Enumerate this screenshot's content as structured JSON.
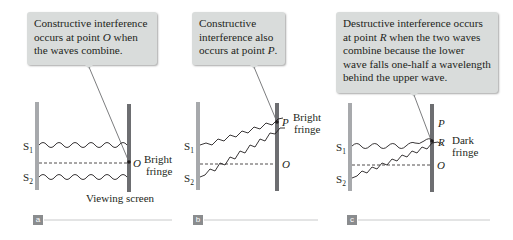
{
  "figure": {
    "panels": [
      {
        "id": "a",
        "tag": "a",
        "callout": {
          "line1": "Constructive interference",
          "line2_pre": "occurs at point ",
          "line2_point": "O",
          "line2_post": " when",
          "line3": "the waves combine."
        },
        "sources": [
          "S",
          "S"
        ],
        "source_subs": [
          "1",
          "2"
        ],
        "point_labels": [
          "O"
        ],
        "fringe_label": [
          "Bright",
          "fringe"
        ],
        "screen_label": "Viewing screen"
      },
      {
        "id": "b",
        "tag": "b",
        "callout": {
          "line1": "Constructive",
          "line2": "interference also",
          "line3_pre": "occurs at point ",
          "line3_point": "P",
          "line3_post": "."
        },
        "sources": [
          "S",
          "S"
        ],
        "source_subs": [
          "1",
          "2"
        ],
        "point_labels": [
          "P",
          "O"
        ],
        "fringe_label": [
          "Bright",
          "fringe"
        ]
      },
      {
        "id": "c",
        "tag": "c",
        "callout": {
          "line1": "Destructive interference occurs",
          "line2_pre": "at point ",
          "line2_point": "R",
          "line2_post": " when the two waves",
          "line3": "combine because the lower",
          "line4": "wave falls one-half a wavelength",
          "line5": "behind the upper wave."
        },
        "sources": [
          "S",
          "S"
        ],
        "source_subs": [
          "1",
          "2"
        ],
        "point_labels": [
          "P",
          "R",
          "O"
        ],
        "fringe_label": [
          "Dark",
          "fringe"
        ]
      }
    ],
    "colors": {
      "callout_bg": "#d9dcdb",
      "slit_barrier": "#a7a9ac",
      "screen": "#6d6e71",
      "wave": "#231f20",
      "tag_bg": "#8a8c8e",
      "rule": "#c8c9ca"
    }
  }
}
